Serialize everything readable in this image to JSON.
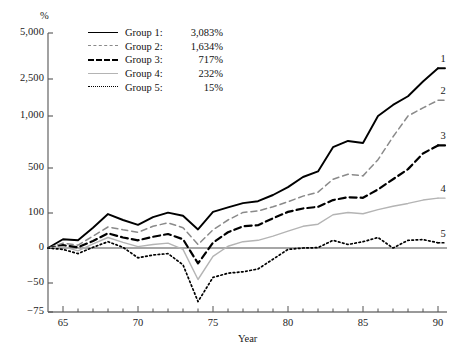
{
  "chart_data": {
    "type": "line",
    "title": "",
    "xlabel": "Year",
    "ylabel": "%",
    "grid": false,
    "legend_position": "top-left",
    "xlim": [
      64,
      90.6
    ],
    "ylim": [
      -75,
      5000
    ],
    "y_scale": "piecewise-nonlinear",
    "xticks": [
      65,
      70,
      75,
      80,
      85,
      90
    ],
    "xtick_labels": [
      "65",
      "70",
      "75",
      "80",
      "85",
      "90"
    ],
    "xticks_minor_every": 1,
    "yticks": [
      -75,
      -50,
      0,
      100,
      500,
      1000,
      2500,
      5000
    ],
    "ytick_labels": [
      "−75",
      "−50",
      "0",
      "100",
      "500",
      "1,000",
      "2,500",
      "5,000"
    ],
    "x": [
      64,
      65,
      66,
      67,
      68,
      69,
      70,
      71,
      72,
      73,
      74,
      75,
      76,
      77,
      78,
      79,
      80,
      81,
      82,
      83,
      84,
      85,
      86,
      87,
      88,
      89,
      90
    ],
    "series": [
      {
        "name": "Group 1",
        "label": "Group 1",
        "end_label": "1",
        "final_value_text": "3,083%",
        "final_value": 3083,
        "style": "solid",
        "color": "#000000",
        "width": 1.9,
        "values": [
          0,
          25,
          22,
          58,
          97,
          80,
          66,
          88,
          103,
          92,
          53,
          110,
          150,
          188,
          205,
          260,
          330,
          420,
          470,
          700,
          760,
          740,
          1000,
          1450,
          1800,
          2400,
          3083
        ]
      },
      {
        "name": "Group 2",
        "label": "Group 2",
        "end_label": "2",
        "final_value_text": "1,634%",
        "final_value": 1634,
        "style": "dashed",
        "color": "#8a8a8a",
        "width": 1.5,
        "values": [
          0,
          14,
          8,
          34,
          60,
          52,
          45,
          62,
          72,
          58,
          10,
          52,
          80,
          105,
          118,
          155,
          200,
          250,
          285,
          400,
          445,
          430,
          580,
          800,
          1000,
          1330,
          1634
        ]
      },
      {
        "name": "Group 3",
        "label": "Group 3",
        "end_label": "3",
        "final_value_text": "717%",
        "final_value": 717,
        "style": "dashed-bold",
        "color": "#000000",
        "width": 2.2,
        "values": [
          0,
          8,
          2,
          20,
          42,
          30,
          22,
          32,
          40,
          25,
          -22,
          15,
          45,
          62,
          65,
          85,
          110,
          140,
          155,
          215,
          240,
          235,
          310,
          400,
          490,
          640,
          717
        ]
      },
      {
        "name": "Group 4",
        "label": "Group 4",
        "end_label": "4",
        "final_value_text": "232%",
        "final_value": 232,
        "style": "solid-light",
        "color": "#b4b4b4",
        "width": 1.4,
        "values": [
          0,
          4,
          -4,
          12,
          30,
          16,
          4,
          10,
          14,
          -2,
          -45,
          -12,
          5,
          18,
          22,
          34,
          48,
          62,
          68,
          95,
          105,
          98,
          130,
          160,
          185,
          215,
          232
        ]
      },
      {
        "name": "Group 5",
        "label": "Group 5",
        "end_label": "5",
        "final_value_text": "15%",
        "final_value": 15,
        "style": "dotted",
        "color": "#000000",
        "width": 1.7,
        "values": [
          0,
          -2,
          -8,
          2,
          18,
          2,
          -14,
          -10,
          -8,
          -24,
          -66,
          -42,
          -36,
          -34,
          -30,
          -16,
          -2,
          0,
          1,
          22,
          10,
          18,
          30,
          0,
          22,
          24,
          15
        ]
      }
    ]
  },
  "legend": {
    "rows": [
      {
        "name": "Group 1:",
        "value": "3,083%"
      },
      {
        "name": "Group 2:",
        "value": "1,634%"
      },
      {
        "name": "Group 3:",
        "value": "717%"
      },
      {
        "name": "Group 4:",
        "value": "232%"
      },
      {
        "name": "Group 5:",
        "value": "15%"
      }
    ]
  },
  "axes": {
    "y_title": "%",
    "x_title": "Year"
  }
}
